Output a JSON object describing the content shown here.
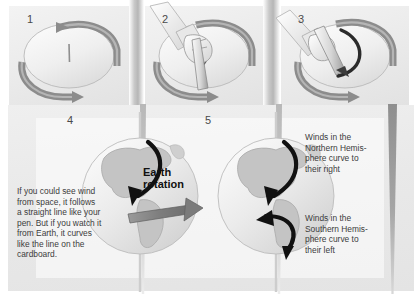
{
  "figure": {
    "background_color": "#ffffff",
    "card_color": "#ebebeb",
    "arrow_gray": "#7d7d7d",
    "arrow_black": "#111111",
    "land_color": "#bdbdbd",
    "ocean_color": "#e4e4e4",
    "text_color": "#3c3c3c"
  },
  "panels": [
    {
      "number": "1",
      "caption": "",
      "description": "cardboard disk with straight pen line, rotation arrows around rim"
    },
    {
      "number": "2",
      "caption": "",
      "description": "hand holding pen drawing while disk turns"
    },
    {
      "number": "3",
      "caption": "",
      "description": "pen drawing curved line on rotating disk"
    },
    {
      "number": "4",
      "caption": "If you could see wind\nfrom space, it follows\na straight line like your\npen. But if you watch it\nfrom Earth, it curves\nlike the line on the\ncardboard.",
      "label": "Earth\nrotation",
      "description": "globe with curving wind arrow and Earth rotation arrow"
    },
    {
      "number": "5",
      "caption_north": "Winds in the\nNorthern Hemis-\nphere curve to\ntheir right",
      "caption_south": "Winds in the\nSouthern Hemis-\nphere curve to\ntheir left",
      "description": "globe with two curving arrows, one per hemisphere"
    }
  ]
}
